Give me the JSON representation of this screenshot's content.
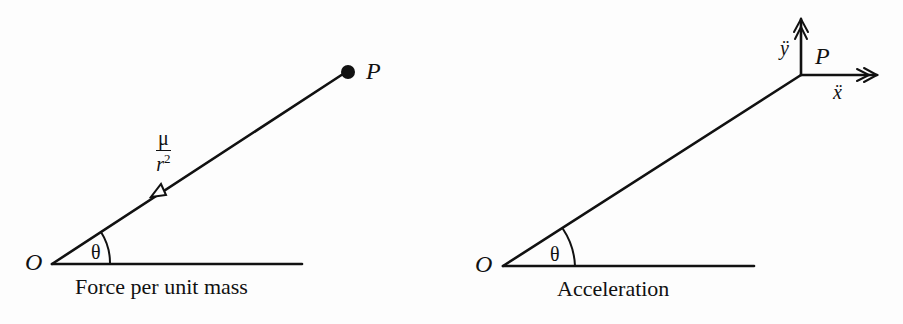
{
  "figure": {
    "left_panel": {
      "origin_label": "O",
      "point_label": "P",
      "angle_label": "θ",
      "force_numerator": "μ",
      "force_denominator_base": "r",
      "force_denominator_exp": "2",
      "caption": "Force per unit mass"
    },
    "right_panel": {
      "origin_label": "O",
      "point_label": "P",
      "angle_label": "θ",
      "y_accel_label": "ÿ",
      "x_accel_label": "ẍ",
      "caption": "Acceleration"
    }
  }
}
